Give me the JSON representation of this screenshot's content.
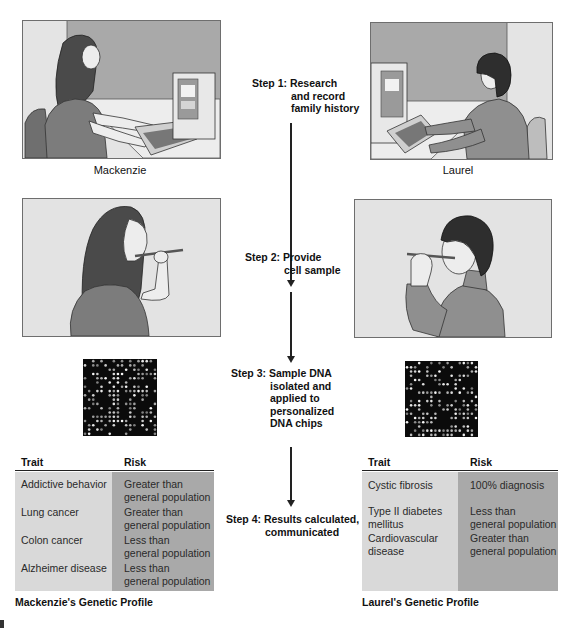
{
  "people": {
    "left": {
      "name": "Mackenzie"
    },
    "right": {
      "name": "Laurel"
    }
  },
  "steps": [
    {
      "lead": "Step 1:",
      "lines": [
        "Research",
        "and record",
        "family history"
      ]
    },
    {
      "lead": "Step 2:",
      "lines": [
        "Provide",
        "cell sample"
      ]
    },
    {
      "lead": "Step 3:",
      "lines": [
        "Sample DNA",
        "isolated and",
        "applied to",
        "personalized",
        "DNA chips"
      ]
    },
    {
      "lead": "Step 4:",
      "lines": [
        "Results calculated,",
        "communicated"
      ]
    }
  ],
  "tables": {
    "left": {
      "headers": [
        "Trait",
        "Risk"
      ],
      "rows": [
        {
          "trait": "Addictive behavior",
          "risk": [
            "Greater than",
            "general population"
          ]
        },
        {
          "trait": "Lung cancer",
          "risk": [
            "Greater than",
            "general population"
          ]
        },
        {
          "trait": "Colon cancer",
          "risk": [
            "Less than",
            "general population"
          ]
        },
        {
          "trait": "Alzheimer disease",
          "risk": [
            "Less than",
            "general population"
          ]
        }
      ],
      "caption": "Mackenzie's Genetic Profile"
    },
    "right": {
      "headers": [
        "Trait",
        "Risk"
      ],
      "rows": [
        {
          "trait": [
            "Cystic fibrosis"
          ],
          "risk": [
            "100% diagnosis"
          ]
        },
        {
          "trait": [
            "Type II diabetes",
            "mellitus"
          ],
          "risk": [
            "Less than",
            "general population"
          ]
        },
        {
          "trait": [
            "Cardiovascular",
            "disease"
          ],
          "risk": [
            "Greater than",
            "general population"
          ]
        }
      ],
      "caption": "Laurel's Genetic Profile"
    }
  },
  "colors": {
    "trait_column": "#d9d9d9",
    "risk_column": "#a9a9a9",
    "chip_background": "#0b0b0b",
    "panel_background": "#e3e3e3",
    "wall": "#a8a8a8"
  }
}
